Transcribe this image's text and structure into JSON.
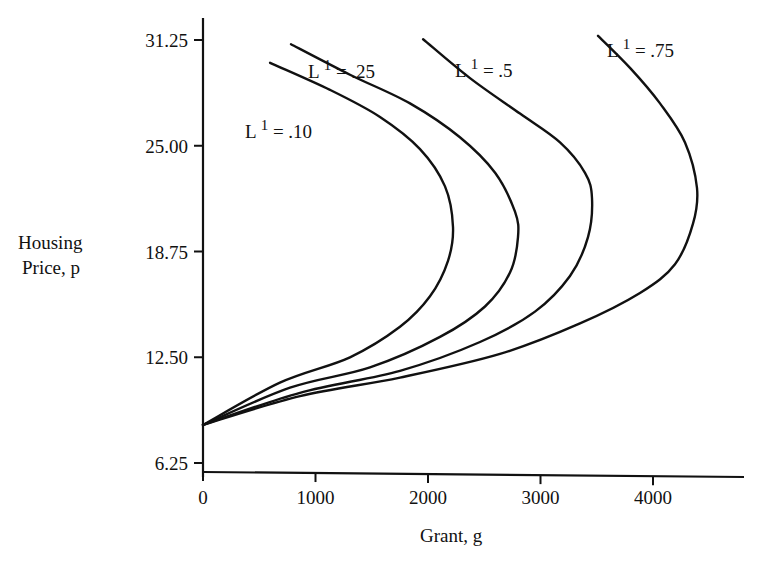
{
  "chart_data": {
    "type": "line",
    "title": "",
    "xlabel": "Grant, g",
    "ylabel": "Housing Price, p",
    "ylabel_lines": [
      "Housing",
      "Price, p"
    ],
    "xlim": [
      0,
      4400
    ],
    "ylim": [
      6.25,
      33.0
    ],
    "x_ticks": [
      0,
      1000,
      2000,
      3000,
      4000
    ],
    "x_tick_labels": [
      "0",
      "1000",
      "2000",
      "3000",
      "4000"
    ],
    "y_ticks": [
      6.25,
      12.5,
      18.75,
      25.0,
      31.25
    ],
    "y_tick_labels": [
      "6.25",
      "12.50",
      "18.75",
      "25.00",
      "31.25"
    ],
    "grid": false,
    "legend": "inline curve labels",
    "series": [
      {
        "name": "L1 = .10",
        "label_main": "L",
        "label_sup": "1",
        "label_value": "= .10",
        "points": [
          {
            "g": 596,
            "p": 29.9
          },
          {
            "g": 1129,
            "p": 28.3
          },
          {
            "g": 1573,
            "p": 26.7
          },
          {
            "g": 1929,
            "p": 24.8
          },
          {
            "g": 2151,
            "p": 22.6
          },
          {
            "g": 2222,
            "p": 20.2
          },
          {
            "g": 2178,
            "p": 18.2
          },
          {
            "g": 2018,
            "p": 16.1
          },
          {
            "g": 1751,
            "p": 14.3
          },
          {
            "g": 1307,
            "p": 12.5
          },
          {
            "g": 684,
            "p": 11.0
          },
          {
            "g": 0,
            "p": 8.5
          }
        ]
      },
      {
        "name": "L1 = .25",
        "label_main": "L",
        "label_sup": "1",
        "label_value": "= .25",
        "points": [
          {
            "g": 782,
            "p": 31.0
          },
          {
            "g": 1307,
            "p": 29.2
          },
          {
            "g": 1840,
            "p": 27.5
          },
          {
            "g": 2284,
            "p": 25.5
          },
          {
            "g": 2596,
            "p": 23.4
          },
          {
            "g": 2773,
            "p": 21.1
          },
          {
            "g": 2800,
            "p": 19.6
          },
          {
            "g": 2729,
            "p": 17.5
          },
          {
            "g": 2507,
            "p": 15.5
          },
          {
            "g": 2107,
            "p": 13.7
          },
          {
            "g": 1484,
            "p": 11.9
          },
          {
            "g": 773,
            "p": 10.7
          },
          {
            "g": 0,
            "p": 8.5
          }
        ]
      },
      {
        "name": "L1 = .5",
        "label_main": "L",
        "label_sup": "1",
        "label_value": "= .5",
        "points": [
          {
            "g": 1956,
            "p": 31.3
          },
          {
            "g": 2373,
            "p": 29.0
          },
          {
            "g": 2818,
            "p": 26.9
          },
          {
            "g": 3173,
            "p": 25.2
          },
          {
            "g": 3396,
            "p": 23.4
          },
          {
            "g": 3458,
            "p": 21.9
          },
          {
            "g": 3422,
            "p": 19.6
          },
          {
            "g": 3262,
            "p": 17.3
          },
          {
            "g": 2951,
            "p": 15.2
          },
          {
            "g": 2462,
            "p": 13.4
          },
          {
            "g": 1751,
            "p": 11.7
          },
          {
            "g": 862,
            "p": 10.4
          },
          {
            "g": 0,
            "p": 8.5
          }
        ]
      },
      {
        "name": "L1 = .75",
        "label_main": "L",
        "label_sup": "1",
        "label_value": "= .75",
        "points": [
          {
            "g": 3511,
            "p": 31.5
          },
          {
            "g": 3796,
            "p": 29.6
          },
          {
            "g": 4062,
            "p": 27.5
          },
          {
            "g": 4284,
            "p": 25.2
          },
          {
            "g": 4391,
            "p": 22.5
          },
          {
            "g": 4356,
            "p": 20.4
          },
          {
            "g": 4196,
            "p": 18.0
          },
          {
            "g": 3884,
            "p": 16.3
          },
          {
            "g": 3351,
            "p": 14.5
          },
          {
            "g": 2640,
            "p": 12.7
          },
          {
            "g": 1751,
            "p": 11.3
          },
          {
            "g": 862,
            "p": 10.2
          },
          {
            "g": 0,
            "p": 8.5
          }
        ]
      }
    ],
    "annotations": [
      "L¹ = .10",
      "L¹ = .25",
      "L¹ = .5",
      "L¹ = .75"
    ]
  },
  "axes": {
    "x_title": "Grant, g",
    "y_title_line1": "Housing",
    "y_title_line2": "Price, p"
  },
  "colors": {
    "ink": "#111111",
    "background": "#ffffff"
  }
}
